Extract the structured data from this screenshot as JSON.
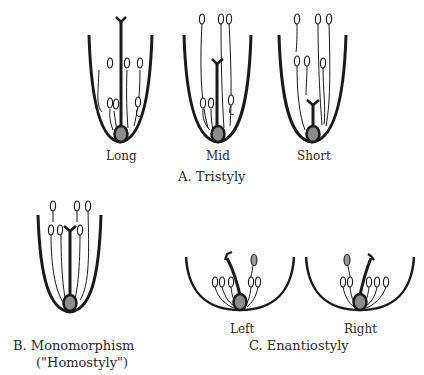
{
  "figure": {
    "section_a": {
      "caption": "A.  Tristyly",
      "morphs": [
        {
          "label": "Long"
        },
        {
          "label": "Mid"
        },
        {
          "label": "Short"
        }
      ]
    },
    "section_b": {
      "caption_line1": "B.  Monomorphism",
      "caption_line2": "(\"Homostyly\")"
    },
    "section_c": {
      "caption": "C.  Enantiostyly",
      "morphs": [
        {
          "label": "Left"
        },
        {
          "label": "Right"
        }
      ]
    },
    "colors": {
      "stroke": "#1a1a1a",
      "ovary_fill": "#8c8c8c",
      "anther_fill_grey": "#9a9a9a",
      "background": "#ffffff"
    }
  }
}
